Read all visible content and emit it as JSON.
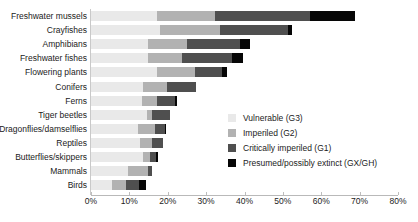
{
  "chart_data": {
    "type": "bar",
    "orientation": "horizontal",
    "stacked": true,
    "title": "",
    "xlabel": "",
    "ylabel": "",
    "xlim": [
      0,
      80
    ],
    "xtick_labels": [
      "0%",
      "10%",
      "20%",
      "30%",
      "40%",
      "50%",
      "60%",
      "70%",
      "80%"
    ],
    "xtick_values": [
      0,
      10,
      20,
      30,
      40,
      50,
      60,
      70,
      80
    ],
    "grid": false,
    "legend_position": "center-right",
    "categories": [
      "Freshwater mussels",
      "Crayfishes",
      "Amphibians",
      "Freshwater fishes",
      "Flowering plants",
      "Conifers",
      "Ferns",
      "Tiger beetles",
      "Dragonflies/damselflies",
      "Reptiles",
      "Butterflies/skippers",
      "Mammals",
      "Birds"
    ],
    "series": [
      {
        "name": "Vulnerable (G3)",
        "color": "#e9e9e9",
        "values": [
          17.2,
          18.0,
          14.8,
          14.8,
          17.2,
          13.5,
          13.3,
          14.6,
          12.2,
          12.8,
          13.5,
          9.6,
          5.5
        ]
      },
      {
        "name": "Imperiled (G2)",
        "color": "#b2b2b2",
        "values": [
          15.1,
          15.6,
          10.2,
          8.9,
          9.9,
          6.3,
          3.9,
          1.3,
          4.4,
          3.1,
          1.8,
          5.2,
          3.6
        ]
      },
      {
        "name": "Critically imperiled (G1)",
        "color": "#4f4f4f",
        "values": [
          24.7,
          17.7,
          13.8,
          13.0,
          7.0,
          7.6,
          4.7,
          4.7,
          2.6,
          2.9,
          1.6,
          1.0,
          3.4
        ]
      },
      {
        "name": "Presumed/possibly extinct (GX/GH)",
        "color": "#060606",
        "values": [
          11.7,
          1.0,
          2.6,
          2.9,
          1.3,
          0.0,
          0.5,
          0.0,
          0.3,
          0.0,
          0.5,
          0.0,
          1.8
        ]
      }
    ],
    "totals": [
      68.7,
      52.3,
      41.4,
      39.6,
      35.4,
      27.4,
      22.4,
      20.6,
      19.5,
      18.8,
      17.4,
      15.8,
      14.3
    ]
  },
  "legend": {
    "items": [
      {
        "label": "Vulnerable (G3)"
      },
      {
        "label": "Imperiled (G2)"
      },
      {
        "label": "Critically imperiled (G1)"
      },
      {
        "label": "Presumed/possibly extinct (GX/GH)"
      }
    ]
  }
}
